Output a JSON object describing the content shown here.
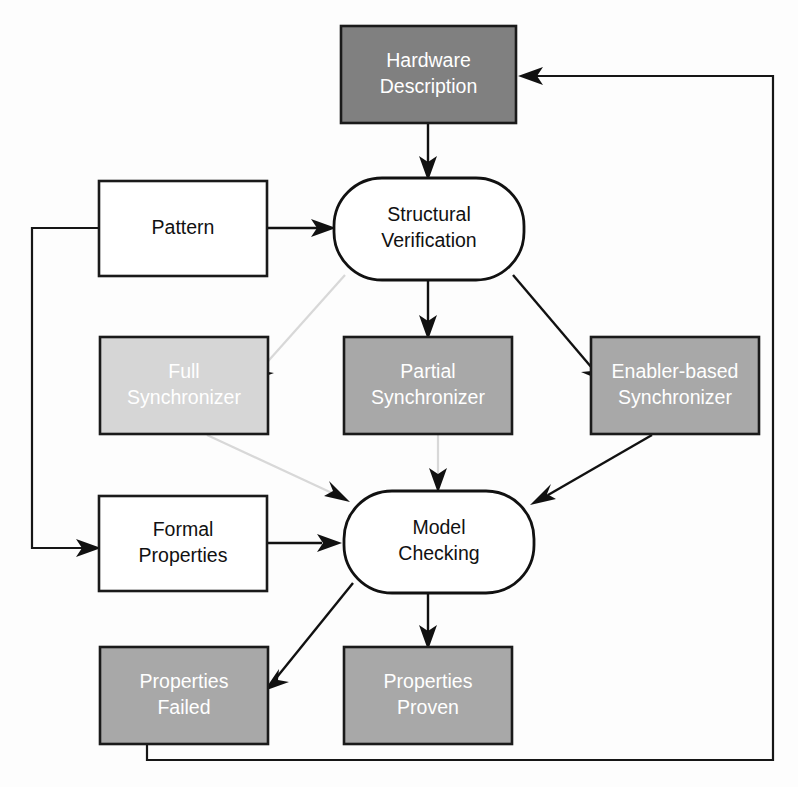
{
  "diagram": {
    "background_color": "#fdfdfd",
    "nodes": [
      {
        "id": "hardware_description",
        "label_line1": "Hardware",
        "label_line2": "Description",
        "shape": "rectangle",
        "fill": "#808080",
        "text_color": "#ffffff",
        "x": 341,
        "y": 26,
        "width": 175,
        "height": 97
      },
      {
        "id": "pattern",
        "label_line1": "Pattern",
        "label_line2": "",
        "shape": "rectangle",
        "fill": "#ffffff",
        "text_color": "#111111",
        "x": 99,
        "y": 181,
        "width": 168,
        "height": 95
      },
      {
        "id": "structural_verification",
        "label_line1": "Structural",
        "label_line2": "Verification",
        "shape": "rounded",
        "fill": "#ffffff",
        "text_color": "#111111",
        "x": 334,
        "y": 178,
        "width": 190,
        "height": 102
      },
      {
        "id": "full_synchronizer",
        "label_line1": "Full",
        "label_line2": "Synchronizer",
        "shape": "rectangle",
        "fill": "#d6d6d6",
        "text_color": "#ffffff",
        "x": 100,
        "y": 337,
        "width": 168,
        "height": 97
      },
      {
        "id": "partial_synchronizer",
        "label_line1": "Partial",
        "label_line2": "Synchronizer",
        "shape": "rectangle",
        "fill": "#a8a8a8",
        "text_color": "#ffffff",
        "x": 344,
        "y": 337,
        "width": 168,
        "height": 97
      },
      {
        "id": "enabler_based_synchronizer",
        "label_line1": "Enabler-based",
        "label_line2": "Synchronizer",
        "shape": "rectangle",
        "fill": "#a8a8a8",
        "text_color": "#ffffff",
        "x": 591,
        "y": 337,
        "width": 168,
        "height": 97
      },
      {
        "id": "formal_properties",
        "label_line1": "Formal",
        "label_line2": "Properties",
        "shape": "rectangle",
        "fill": "#ffffff",
        "text_color": "#111111",
        "x": 99,
        "y": 496,
        "width": 168,
        "height": 95
      },
      {
        "id": "model_checking",
        "label_line1": "Model",
        "label_line2": "Checking",
        "shape": "rounded",
        "fill": "#ffffff",
        "text_color": "#111111",
        "x": 344,
        "y": 491,
        "width": 190,
        "height": 102
      },
      {
        "id": "properties_failed",
        "label_line1": "Properties",
        "label_line2": "Failed",
        "shape": "rectangle",
        "fill": "#a8a8a8",
        "text_color": "#ffffff",
        "x": 100,
        "y": 647,
        "width": 168,
        "height": 97
      },
      {
        "id": "properties_proven",
        "label_line1": "Properties",
        "label_line2": "Proven",
        "shape": "rectangle",
        "fill": "#a8a8a8",
        "text_color": "#ffffff",
        "x": 344,
        "y": 647,
        "width": 168,
        "height": 97
      }
    ],
    "edges": [
      {
        "id": "hw_to_sv",
        "from": "hardware_description",
        "to": "structural_verification",
        "style": "solid"
      },
      {
        "id": "pattern_to_sv",
        "from": "pattern",
        "to": "structural_verification",
        "style": "solid"
      },
      {
        "id": "sv_to_full",
        "from": "structural_verification",
        "to": "full_synchronizer",
        "style": "faint"
      },
      {
        "id": "sv_to_partial",
        "from": "structural_verification",
        "to": "partial_synchronizer",
        "style": "solid"
      },
      {
        "id": "sv_to_enabler",
        "from": "structural_verification",
        "to": "enabler_based_synchronizer",
        "style": "solid"
      },
      {
        "id": "full_to_mc",
        "from": "full_synchronizer",
        "to": "model_checking",
        "style": "faint"
      },
      {
        "id": "partial_to_mc",
        "from": "partial_synchronizer",
        "to": "model_checking",
        "style": "faint"
      },
      {
        "id": "enabler_to_mc",
        "from": "enabler_based_synchronizer",
        "to": "model_checking",
        "style": "solid"
      },
      {
        "id": "fp_to_mc",
        "from": "formal_properties",
        "to": "model_checking",
        "style": "solid"
      },
      {
        "id": "mc_to_failed",
        "from": "model_checking",
        "to": "properties_failed",
        "style": "solid"
      },
      {
        "id": "mc_to_proven",
        "from": "model_checking",
        "to": "properties_proven",
        "style": "solid"
      },
      {
        "id": "pattern_to_fp_loop",
        "from": "pattern",
        "to": "formal_properties",
        "style": "loop"
      },
      {
        "id": "failed_to_hw_loop",
        "from": "properties_failed",
        "to": "hardware_description",
        "style": "loop"
      }
    ]
  }
}
